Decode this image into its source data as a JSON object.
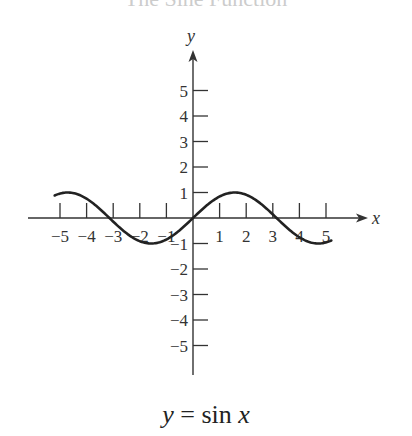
{
  "title": "The Sine Function",
  "equation": {
    "lhs": "y",
    "eq": "=",
    "fn": "sin",
    "var": "x"
  },
  "axes": {
    "xlabel": "x",
    "ylabel": "y"
  },
  "chart_data": {
    "type": "line",
    "title": "The Sine Function",
    "xlabel": "x",
    "ylabel": "y",
    "function": "y = sin x",
    "xlim": [
      -5.2,
      5.2
    ],
    "ylim": [
      -5,
      5
    ],
    "xticks": [
      -5,
      -4,
      -3,
      -2,
      -1,
      1,
      2,
      3,
      4,
      5
    ],
    "yticks": [
      -5,
      -4,
      -3,
      -2,
      -1,
      1,
      2,
      3,
      4,
      5
    ],
    "grid": false,
    "series": [
      {
        "name": "sin x",
        "x_range": [
          -5.2,
          5.2
        ],
        "points": [
          [
            -5,
            0.96
          ],
          [
            -4.71,
            1
          ],
          [
            -4,
            0.76
          ],
          [
            -3.14,
            0
          ],
          [
            -2,
            -0.91
          ],
          [
            -1.57,
            -1
          ],
          [
            -1,
            -0.84
          ],
          [
            0,
            0
          ],
          [
            1,
            0.84
          ],
          [
            1.57,
            1
          ],
          [
            2,
            0.91
          ],
          [
            3.14,
            0
          ],
          [
            4,
            -0.76
          ],
          [
            4.71,
            -1
          ],
          [
            5,
            -0.96
          ]
        ]
      }
    ]
  }
}
